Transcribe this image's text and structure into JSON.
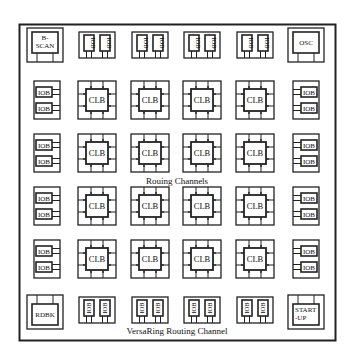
{
  "diagram": {
    "frame_color": "#222222",
    "background": "#ffffff",
    "corners": {
      "top_left": "B-\nSCAN",
      "top_right": "OSC",
      "bottom_left": "RDBK",
      "bottom_right": "START\n-UP"
    },
    "clb_label": "CLB",
    "iob_label": "IOB",
    "grid": {
      "rows": 4,
      "cols": 4
    },
    "top_iob_pairs": 4,
    "bottom_iob_pairs": 4,
    "left_iob_pairs": 4,
    "right_iob_pairs": 4,
    "labels": {
      "routing_channels": "Rouing Channels",
      "versaring": "VersaRing Routing Channel"
    }
  }
}
